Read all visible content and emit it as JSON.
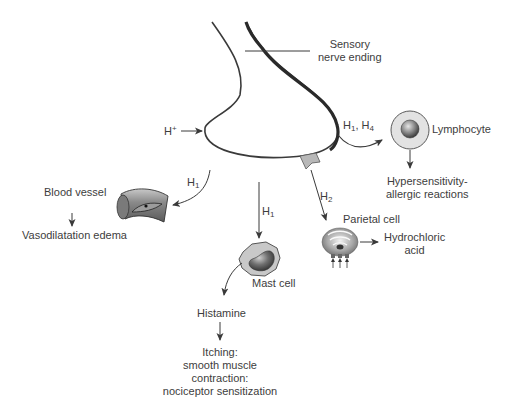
{
  "diagram": {
    "nerve": {
      "label_line1": "Sensory",
      "label_line2": "nerve ending"
    },
    "stimulus": {
      "ion": "H",
      "charge": "+"
    },
    "receptors": {
      "h1": {
        "base": "H",
        "sub": "1"
      },
      "h2": {
        "base": "H",
        "sub": "2"
      },
      "h1h4": {
        "a_base": "H",
        "a_sub": "1",
        "sep": ", ",
        "b_base": "H",
        "b_sub": "4"
      }
    },
    "lymphocyte": {
      "label": "Lymphocyte",
      "effect_line1": "Hypersensitivity-",
      "effect_line2": "allergic reactions"
    },
    "parietal_cell": {
      "label": "Parietal cell",
      "product_line1": "Hydrochloric",
      "product_line2": "acid"
    },
    "blood_vessel": {
      "label": "Blood vessel",
      "effect": "Vasodilatation edema"
    },
    "mast_cell": {
      "label": "Mast cell",
      "release": "Histamine",
      "effect_line1": "Itching:",
      "effect_line2": "smooth muscle",
      "effect_line3": "contraction:",
      "effect_line4": "nociceptor sensitization"
    },
    "colors": {
      "line": "#3a3a3a",
      "text": "#3d3d3d",
      "cell_fill": "#d8d8d8",
      "nucleus_dark": "#4a4a4a",
      "receptor_fill": "#b8b8b8"
    }
  }
}
